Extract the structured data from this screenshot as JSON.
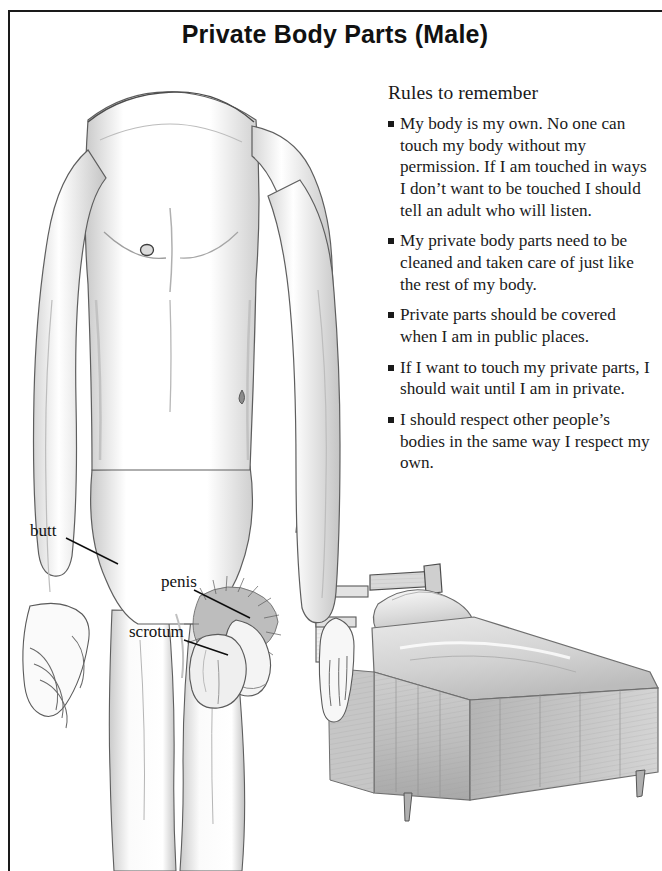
{
  "page": {
    "title": "Private Body Parts (Male)"
  },
  "rules": {
    "heading": "Rules to remember",
    "items": [
      "My body is my own. No one can touch my body without my permission. If I am touched in ways I don’t want to be touched I should tell an adult who will listen.",
      "My private body parts need to be cleaned and taken care of just like the rest of my body.",
      "Private parts should be covered when I am in public places.",
      "If I want to touch my private parts, I should wait until I am in private.",
      "I should respect other people’s bodies in the same way I respect my own."
    ]
  },
  "anatomy_labels": [
    {
      "label": "butt"
    },
    {
      "label": "penis"
    },
    {
      "label": "scrotum"
    }
  ],
  "illustration": {
    "figure_name": "male-torso-pencil-drawing",
    "object_name": "bed-pencil-drawing",
    "medium": "pencil sketch",
    "line_color": "#3a3a3a",
    "shade_color": "#b9b9b9"
  }
}
